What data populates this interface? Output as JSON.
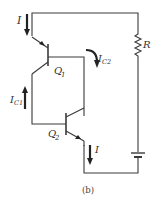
{
  "diagram": {
    "type": "circuit-schematic",
    "caption": "(b)",
    "components": {
      "q1": {
        "label": "Q",
        "sub": "1",
        "kind": "npn-transistor"
      },
      "q2": {
        "label": "Q",
        "sub": "2",
        "kind": "npn-transistor"
      },
      "resistor": {
        "label": "R"
      },
      "battery": {
        "label": ""
      }
    },
    "currents": {
      "i_top": {
        "label": "I",
        "direction": "down"
      },
      "i_c1": {
        "label": "I",
        "sub": "C1",
        "direction": "up"
      },
      "i_c2": {
        "label": "I",
        "sub": "C2",
        "direction": "down"
      },
      "i_bottom": {
        "label": "I",
        "direction": "down"
      }
    },
    "colors": {
      "wire": "#3a3a3a",
      "text": "#333333",
      "background": "#ffffff"
    }
  }
}
